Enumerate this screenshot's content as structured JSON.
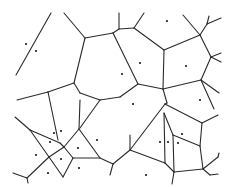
{
  "diagram": {
    "type": "voronoi",
    "width": 229,
    "height": 187,
    "colors": {
      "background": "#ffffff",
      "edge": "#2a2a2a",
      "site": "#1a1a1a"
    },
    "edges": [
      [
        51,
        13,
        16,
        75
      ],
      [
        64,
        13,
        85,
        38
      ],
      [
        85,
        38,
        113,
        33
      ],
      [
        85,
        38,
        74,
        83
      ],
      [
        74,
        83,
        48,
        92
      ],
      [
        48,
        92,
        17,
        100
      ],
      [
        74,
        83,
        80,
        93
      ],
      [
        80,
        93,
        100,
        100
      ],
      [
        113,
        33,
        119,
        29
      ],
      [
        119,
        29,
        119,
        13
      ],
      [
        119,
        29,
        134,
        28
      ],
      [
        134,
        28,
        144,
        13
      ],
      [
        134,
        28,
        164,
        50
      ],
      [
        113,
        33,
        138,
        84
      ],
      [
        164,
        50,
        200,
        35
      ],
      [
        200,
        35,
        183,
        15
      ],
      [
        200,
        35,
        207,
        24
      ],
      [
        207,
        24,
        209,
        16
      ],
      [
        207,
        24,
        221,
        18
      ],
      [
        200,
        35,
        211,
        57
      ],
      [
        211,
        57,
        221,
        53
      ],
      [
        211,
        57,
        221,
        62
      ],
      [
        211,
        57,
        201,
        80
      ],
      [
        164,
        50,
        163,
        89
      ],
      [
        163,
        89,
        138,
        84
      ],
      [
        138,
        84,
        120,
        97
      ],
      [
        163,
        89,
        201,
        80
      ],
      [
        201,
        80,
        219,
        93
      ],
      [
        201,
        80,
        214,
        109
      ],
      [
        163,
        89,
        167,
        103
      ],
      [
        100,
        100,
        120,
        97
      ],
      [
        100,
        100,
        80,
        128
      ],
      [
        80,
        100,
        79,
        129
      ],
      [
        48,
        92,
        58,
        140
      ],
      [
        15,
        117,
        30,
        130
      ],
      [
        30,
        130,
        60,
        143
      ],
      [
        30,
        130,
        49,
        157
      ],
      [
        60,
        143,
        64,
        147
      ],
      [
        79,
        129,
        64,
        147
      ],
      [
        64,
        147,
        49,
        157
      ],
      [
        64,
        147,
        73,
        158
      ],
      [
        49,
        157,
        63,
        177
      ],
      [
        73,
        158,
        63,
        177
      ],
      [
        49,
        157,
        27,
        178
      ],
      [
        27,
        178,
        13,
        173
      ],
      [
        27,
        178,
        28,
        183
      ],
      [
        79,
        129,
        100,
        158
      ],
      [
        100,
        158,
        73,
        158
      ],
      [
        100,
        158,
        113,
        164
      ],
      [
        113,
        164,
        110,
        175
      ],
      [
        113,
        164,
        130,
        150
      ],
      [
        130,
        150,
        165,
        104
      ],
      [
        130,
        150,
        130,
        135
      ],
      [
        165,
        104,
        167,
        103
      ],
      [
        165,
        104,
        202,
        123
      ],
      [
        202,
        123,
        218,
        115
      ],
      [
        202,
        123,
        200,
        146
      ],
      [
        164,
        113,
        165,
        163
      ],
      [
        164,
        113,
        173,
        135
      ],
      [
        173,
        135,
        174,
        172
      ],
      [
        173,
        135,
        200,
        146
      ],
      [
        200,
        146,
        203,
        169
      ],
      [
        165,
        163,
        130,
        150
      ],
      [
        165,
        163,
        174,
        172
      ],
      [
        174,
        172,
        203,
        169
      ],
      [
        203,
        169,
        218,
        157
      ],
      [
        218,
        157,
        219,
        153
      ],
      [
        203,
        169,
        210,
        175
      ],
      [
        210,
        175,
        218,
        174
      ],
      [
        174,
        172,
        172,
        184
      ]
    ],
    "sites": [
      [
        26,
        44
      ],
      [
        36,
        51
      ],
      [
        167,
        21
      ],
      [
        140,
        63
      ],
      [
        186,
        66
      ],
      [
        122,
        74
      ],
      [
        200,
        100
      ],
      [
        133,
        104
      ],
      [
        54,
        133
      ],
      [
        61,
        131
      ],
      [
        50,
        142
      ],
      [
        36,
        155
      ],
      [
        61,
        159
      ],
      [
        78,
        148
      ],
      [
        79,
        168
      ],
      [
        48,
        173
      ],
      [
        97,
        140
      ],
      [
        160,
        142
      ],
      [
        168,
        142
      ],
      [
        178,
        143
      ],
      [
        182,
        134
      ],
      [
        146,
        175
      ]
    ]
  }
}
